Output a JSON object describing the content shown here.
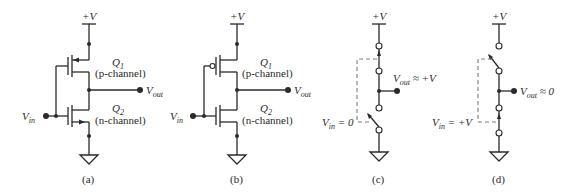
{
  "figure": {
    "panels": [
      {
        "caption": "(a)",
        "supply": "+V",
        "q1_name": "Q",
        "q1_sub": "1",
        "q1_type": "(p-channel)",
        "q2_name": "Q",
        "q2_sub": "2",
        "q2_type": "(n-channel)",
        "vin_main": "V",
        "vin_sub": "in",
        "vout_main": "V",
        "vout_sub": "out"
      },
      {
        "caption": "(b)",
        "supply": "+V",
        "q1_name": "Q",
        "q1_sub": "1",
        "q1_type": "(p-channel)",
        "q2_name": "Q",
        "q2_sub": "2",
        "q2_type": "(n-channel)",
        "vin_main": "V",
        "vin_sub": "in",
        "vout_main": "V",
        "vout_sub": "out"
      },
      {
        "caption": "(c)",
        "supply": "+V",
        "vin_main": "V",
        "vin_sub": "in",
        "vin_value": " = 0",
        "vout_main": "V",
        "vout_sub": "out",
        "vout_value": " ≈ +V"
      },
      {
        "caption": "(d)",
        "supply": "+V",
        "vin_main": "V",
        "vin_sub": "in",
        "vin_value": " = +V",
        "vout_main": "V",
        "vout_sub": "out",
        "vout_value": " ≈ 0"
      }
    ]
  }
}
